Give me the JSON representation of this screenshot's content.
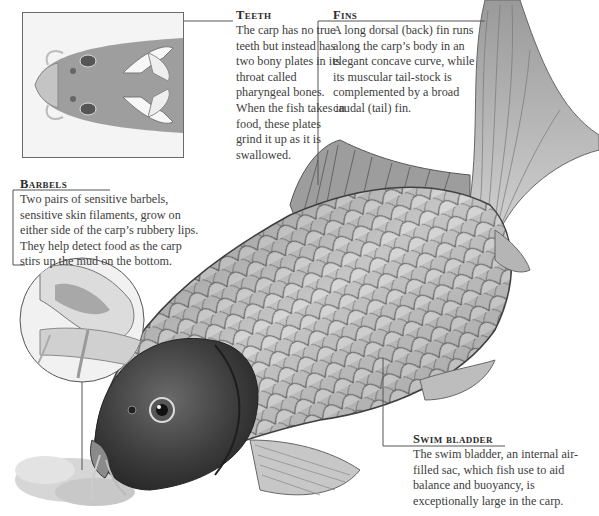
{
  "diagram": {
    "callouts": {
      "teeth": {
        "title": "Teeth",
        "body": "The carp has no true teeth but instead has two bony plates in its throat called pharyngeal bones. When the fish takes in food, these plates grind it up as it is swallowed."
      },
      "fins": {
        "title": "Fins",
        "body": "A long dorsal (back) fin runs along the carp’s body in an elegant concave curve, while its muscular tail-stock is complemented by a broad caudal (tail) fin."
      },
      "barbels": {
        "title": "Barbels",
        "body": "Two pairs of sensitive barbels, sensitive skin filaments, grow on either side of the carp’s rubbery lips. They help detect food as the carp stirs up the mud on the bottom."
      },
      "swim_bladder": {
        "title": "Swim bladder",
        "body": "The swim bladder, an internal air-filled sac, which fish use to aid balance and buoyancy, is exceptionally large in the carp."
      }
    },
    "insets": [
      {
        "name": "underside-of-head",
        "label": "Ventral view of head showing pharyngeal plates"
      },
      {
        "name": "lips-and-barbels",
        "label": "Close-up of lips and barbels"
      }
    ],
    "colors": {
      "leader_line": "#555555",
      "text": "#3d3d3d",
      "scale_light": "#d8d8d8",
      "scale_dark": "#6b6b6b",
      "head_dark": "#3a3a3a"
    }
  }
}
